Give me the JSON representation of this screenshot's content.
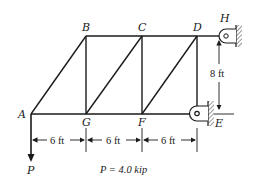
{
  "diagram": {
    "nodes": {
      "A": {
        "label": "A",
        "x": 31,
        "y": 114
      },
      "G": {
        "label": "G",
        "x": 86,
        "y": 114
      },
      "F": {
        "label": "F",
        "x": 142,
        "y": 114
      },
      "E": {
        "label": "E",
        "x": 197,
        "y": 114
      },
      "B": {
        "label": "B",
        "x": 86,
        "y": 36
      },
      "C": {
        "label": "C",
        "x": 142,
        "y": 36
      },
      "D": {
        "label": "D",
        "x": 197,
        "y": 36
      },
      "H": {
        "label": "H",
        "x": 226,
        "y": 36
      }
    },
    "members": [
      [
        "A",
        "G"
      ],
      [
        "G",
        "F"
      ],
      [
        "F",
        "E"
      ],
      [
        "B",
        "C"
      ],
      [
        "C",
        "D"
      ],
      [
        "D",
        "H"
      ],
      [
        "A",
        "B"
      ],
      [
        "G",
        "B"
      ],
      [
        "F",
        "C"
      ],
      [
        "E",
        "D"
      ],
      [
        "G",
        "C"
      ],
      [
        "F",
        "D"
      ]
    ],
    "supports": {
      "H": "pin",
      "E": "roller"
    },
    "load": {
      "label": "P",
      "at": "A",
      "direction": "down",
      "value_text": "P = 4.0 kip"
    },
    "dimensions": {
      "horizontal": [
        "6 ft",
        "6 ft",
        "6 ft"
      ],
      "vertical": "8 ft"
    },
    "colors": {
      "line": "#1a1a1a",
      "background": "#ffffff",
      "hatch": "#555555"
    }
  }
}
